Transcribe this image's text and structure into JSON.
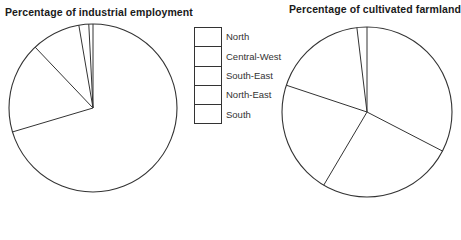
{
  "chart_data": [
    {
      "type": "pie",
      "title": "Percentage of industrial employment",
      "categories": [
        "South-East",
        "Central-West",
        "North-East",
        "South",
        "North"
      ],
      "values": [
        70.4,
        17.5,
        9.4,
        1.9,
        0.8
      ],
      "start_angle_deg": 0,
      "direction": "clockwise",
      "fill": "#ffffff",
      "stroke": "#333333"
    },
    {
      "type": "pie",
      "title": "Percentage of cultivated farmland",
      "categories": [
        "South-East",
        "South",
        "North-East",
        "Central-West",
        "North"
      ],
      "values": [
        32.6,
        25.9,
        21.6,
        18.0,
        1.9
      ],
      "start_angle_deg": 0,
      "direction": "clockwise",
      "fill": "#ffffff",
      "stroke": "#333333"
    }
  ],
  "legend": {
    "items": [
      {
        "label": "North"
      },
      {
        "label": "Central-West"
      },
      {
        "label": "South-East"
      },
      {
        "label": "North-East"
      },
      {
        "label": "South"
      }
    ]
  },
  "titles": {
    "left": "Percentage of industrial employment",
    "right": "Percentage of cultivated farmland"
  }
}
